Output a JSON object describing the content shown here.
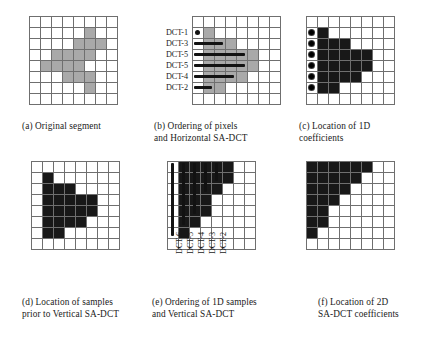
{
  "figure": {
    "grid_size": 8,
    "colors": {
      "segment_fill": "#a9a9a9",
      "coefficient_fill": "#181818",
      "grid_line": "#6f6f6f",
      "background": "#ffffff",
      "mark": "#121212"
    }
  },
  "panels": [
    {
      "id": "a",
      "caption": "(a) Original segment",
      "cell_style": "gray",
      "rows": [
        [],
        [
          5
        ],
        [
          4,
          5,
          6
        ],
        [
          2,
          3,
          4,
          5
        ],
        [
          1,
          2,
          3,
          4
        ],
        [
          3,
          4,
          5
        ],
        [
          5
        ],
        []
      ]
    },
    {
      "id": "b",
      "caption": "(b) Ordering of pixels\nand Horizontal SA-DCT",
      "cell_style": "gray",
      "rows": [
        [],
        [
          1
        ],
        [
          1,
          2,
          3
        ],
        [
          1,
          2,
          3,
          4,
          5
        ],
        [
          1,
          2,
          3,
          4,
          5
        ],
        [
          1,
          2,
          3,
          4
        ],
        [
          1,
          2
        ],
        []
      ],
      "row_labels": [
        {
          "row": 1,
          "text": "DCT-1"
        },
        {
          "row": 2,
          "text": "DCT-3"
        },
        {
          "row": 3,
          "text": "DCT-5"
        },
        {
          "row": 4,
          "text": "DCT-5"
        },
        {
          "row": 5,
          "text": "DCT-4"
        },
        {
          "row": 6,
          "text": "DCT-2"
        }
      ],
      "marks": {
        "type": "horizontal",
        "dot_row": 1,
        "bars": [
          {
            "row": 2,
            "start": 1,
            "length": 3
          },
          {
            "row": 3,
            "start": 1,
            "length": 5
          },
          {
            "row": 4,
            "start": 1,
            "length": 5
          },
          {
            "row": 5,
            "start": 1,
            "length": 4
          },
          {
            "row": 6,
            "start": 1,
            "length": 2
          }
        ]
      }
    },
    {
      "id": "c",
      "caption": "(c) Location of 1D\ncoefficients",
      "cell_style": "black",
      "rows": [
        [],
        [
          1
        ],
        [
          1,
          2,
          3
        ],
        [
          1,
          2,
          3,
          4,
          5
        ],
        [
          1,
          2,
          3,
          4,
          5
        ],
        [
          1,
          2,
          3,
          4
        ],
        [
          1,
          2
        ],
        []
      ],
      "marks": {
        "type": "dots",
        "dot_rows": [
          1,
          2,
          3,
          4,
          5,
          6
        ]
      }
    },
    {
      "id": "d",
      "caption": "(d) Location of samples\nprior to Vertical SA-DCT",
      "cell_style": "black",
      "rows": [
        [],
        [
          1
        ],
        [
          1,
          2,
          3
        ],
        [
          1,
          2,
          3,
          4,
          5
        ],
        [
          1,
          2,
          3,
          4,
          5
        ],
        [
          1,
          2,
          3,
          4
        ],
        [
          1,
          2
        ],
        []
      ]
    },
    {
      "id": "e",
      "caption": "(e) Ordering of 1D samples\nand Vertical SA-DCT",
      "cell_style": "black",
      "rows": [
        [
          1,
          2,
          3,
          4,
          5
        ],
        [
          1,
          2,
          3,
          4,
          5
        ],
        [
          1,
          2,
          3,
          4
        ],
        [
          1,
          2,
          3
        ],
        [
          1,
          2,
          3
        ],
        [
          1,
          2
        ],
        [
          1
        ],
        []
      ],
      "col_labels": [
        {
          "col": 1,
          "text": "DCT-6"
        },
        {
          "col": 2,
          "text": "DCT-5"
        },
        {
          "col": 3,
          "text": "DCT-4"
        },
        {
          "col": 4,
          "text": "DCT-3"
        },
        {
          "col": 5,
          "text": "DCT-2"
        }
      ],
      "marks": {
        "type": "vertical",
        "bars": [
          {
            "col": 1,
            "start": 0,
            "length": 7
          },
          {
            "col": 2,
            "start": 0,
            "length": 6
          },
          {
            "col": 3,
            "start": 0,
            "length": 5
          },
          {
            "col": 4,
            "start": 0,
            "length": 3
          },
          {
            "col": 5,
            "start": 0,
            "length": 2
          }
        ]
      }
    },
    {
      "id": "f",
      "caption": "(f) Location of 2D\nSA-DCT coefficients",
      "cell_style": "black",
      "rows": [
        [
          0,
          1,
          2,
          3,
          4,
          5
        ],
        [
          0,
          1,
          2,
          3,
          4
        ],
        [
          0,
          1,
          2,
          3
        ],
        [
          0,
          1,
          2
        ],
        [
          0,
          1
        ],
        [
          0,
          1
        ],
        [
          0
        ],
        []
      ]
    }
  ]
}
